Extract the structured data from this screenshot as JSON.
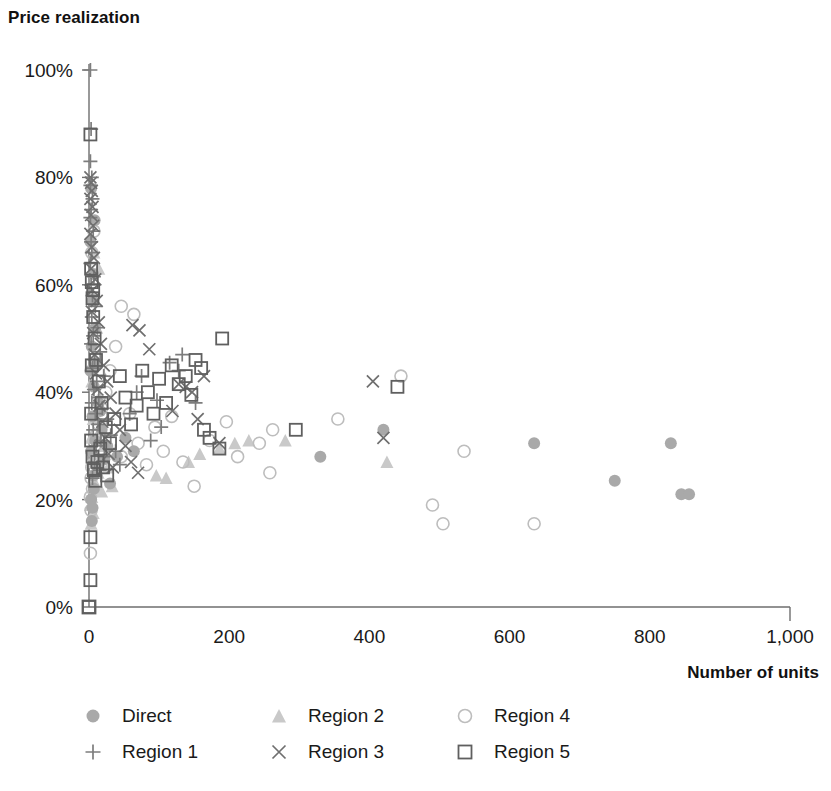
{
  "chart_data": {
    "type": "scatter",
    "title": "Price realization",
    "xlabel": "Number of units",
    "ylabel": "Price realization",
    "xlim": [
      0,
      1000
    ],
    "ylim": [
      0,
      1.0
    ],
    "grid": false,
    "legend_position": "bottom-left",
    "x_ticks": [
      0,
      200,
      400,
      600,
      800,
      1000
    ],
    "x_tick_labels": [
      "0",
      "200",
      "400",
      "600",
      "800",
      "1,000"
    ],
    "y_ticks": [
      0,
      20,
      40,
      60,
      80,
      100
    ],
    "y_tick_labels": [
      "0%",
      "20%",
      "40%",
      "60%",
      "80%",
      "100%"
    ],
    "series": [
      {
        "name": "Direct",
        "marker": "filled-circle",
        "color": "#a9a9a9",
        "points": [
          [
            330,
            28.0
          ],
          [
            420,
            33.0
          ],
          [
            635,
            30.5
          ],
          [
            750,
            23.5
          ],
          [
            830,
            30.5
          ],
          [
            845,
            21.0
          ],
          [
            856,
            21.0
          ],
          [
            6,
            62.0
          ],
          [
            5,
            57.0
          ],
          [
            9,
            52.0
          ],
          [
            4,
            48.5
          ],
          [
            11,
            45.0
          ],
          [
            7,
            41.0
          ],
          [
            14,
            38.0
          ],
          [
            5,
            35.5
          ],
          [
            18,
            33.0
          ],
          [
            9,
            31.0
          ],
          [
            3,
            29.0
          ],
          [
            22,
            27.5
          ],
          [
            12,
            26.0
          ],
          [
            6,
            24.5
          ],
          [
            30,
            23.0
          ],
          [
            16,
            36.5
          ],
          [
            26,
            30.0
          ],
          [
            40,
            28.0
          ],
          [
            52,
            31.5
          ],
          [
            64,
            29.0
          ],
          [
            3,
            20.0
          ],
          [
            5,
            18.5
          ],
          [
            4,
            16.0
          ],
          [
            7,
            22.0
          ],
          [
            2,
            44.0
          ],
          [
            2,
            68.0
          ],
          [
            8,
            72.0
          ],
          [
            3,
            78.0
          ]
        ]
      },
      {
        "name": "Region 1",
        "marker": "plus",
        "color": "#7d7d7d",
        "points": [
          [
            2,
            100.0
          ],
          [
            3,
            89.0
          ],
          [
            2,
            83.0
          ],
          [
            4,
            80.0
          ],
          [
            2,
            78.5
          ],
          [
            5,
            76.0
          ],
          [
            3,
            74.0
          ],
          [
            2,
            72.5
          ],
          [
            6,
            70.0
          ],
          [
            3,
            68.0
          ],
          [
            4,
            66.0
          ],
          [
            2,
            64.0
          ],
          [
            7,
            61.5
          ],
          [
            3,
            60.0
          ],
          [
            5,
            58.0
          ],
          [
            9,
            56.0
          ],
          [
            4,
            54.0
          ],
          [
            12,
            52.0
          ],
          [
            6,
            50.5
          ],
          [
            3,
            49.0
          ],
          [
            16,
            47.5
          ],
          [
            8,
            46.0
          ],
          [
            5,
            44.5
          ],
          [
            21,
            43.0
          ],
          [
            11,
            42.0
          ],
          [
            7,
            40.5
          ],
          [
            14,
            39.0
          ],
          [
            4,
            38.0
          ],
          [
            19,
            37.0
          ],
          [
            9,
            36.0
          ],
          [
            26,
            35.0
          ],
          [
            13,
            34.0
          ],
          [
            6,
            33.0
          ],
          [
            31,
            32.0
          ],
          [
            17,
            31.0
          ],
          [
            10,
            30.0
          ],
          [
            38,
            29.0
          ],
          [
            22,
            28.0
          ],
          [
            8,
            27.0
          ],
          [
            44,
            26.5
          ],
          [
            15,
            25.5
          ],
          [
            5,
            24.0
          ],
          [
            115,
            45.5
          ],
          [
            128,
            44.0
          ],
          [
            97,
            38.5
          ],
          [
            103,
            33.5
          ],
          [
            88,
            31.0
          ],
          [
            133,
            47.0
          ],
          [
            75,
            43.0
          ],
          [
            68,
            40.0
          ],
          [
            152,
            38.0
          ],
          [
            58,
            36.0
          ]
        ]
      },
      {
        "name": "Region 2",
        "marker": "filled-triangle",
        "color": "#c9c9c9",
        "points": [
          [
            280,
            31.0
          ],
          [
            425,
            27.0
          ],
          [
            208,
            30.5
          ],
          [
            228,
            31.0
          ],
          [
            186,
            29.5
          ],
          [
            96,
            24.5
          ],
          [
            110,
            24.0
          ],
          [
            142,
            27.0
          ],
          [
            158,
            28.5
          ],
          [
            8,
            46.0
          ],
          [
            4,
            42.0
          ],
          [
            12,
            38.5
          ],
          [
            6,
            35.0
          ],
          [
            16,
            33.0
          ],
          [
            3,
            31.5
          ],
          [
            21,
            30.0
          ],
          [
            9,
            28.5
          ],
          [
            5,
            27.0
          ],
          [
            27,
            26.0
          ],
          [
            13,
            25.0
          ],
          [
            7,
            23.5
          ],
          [
            33,
            22.5
          ],
          [
            18,
            21.5
          ],
          [
            4,
            20.5
          ],
          [
            2,
            19.0
          ],
          [
            6,
            17.5
          ],
          [
            3,
            15.5
          ],
          [
            11,
            52.0
          ],
          [
            5,
            58.0
          ],
          [
            14,
            63.0
          ],
          [
            7,
            66.0
          ]
        ]
      },
      {
        "name": "Region 3",
        "marker": "cross",
        "color": "#6f6f6f",
        "points": [
          [
            405,
            42.0
          ],
          [
            420,
            31.5
          ],
          [
            62,
            52.5
          ],
          [
            72,
            51.5
          ],
          [
            86,
            48.0
          ],
          [
            128,
            41.5
          ],
          [
            138,
            41.0
          ],
          [
            147,
            40.0
          ],
          [
            164,
            43.0
          ],
          [
            186,
            30.5
          ],
          [
            155,
            35.0
          ],
          [
            119,
            36.5
          ],
          [
            2,
            80.0
          ],
          [
            3,
            79.0
          ],
          [
            4,
            77.5
          ],
          [
            2,
            76.0
          ],
          [
            5,
            74.5
          ],
          [
            3,
            73.0
          ],
          [
            6,
            71.0
          ],
          [
            2,
            69.5
          ],
          [
            4,
            67.0
          ],
          [
            7,
            65.0
          ],
          [
            3,
            63.0
          ],
          [
            9,
            61.0
          ],
          [
            5,
            59.0
          ],
          [
            11,
            57.0
          ],
          [
            4,
            55.0
          ],
          [
            14,
            53.0
          ],
          [
            6,
            51.0
          ],
          [
            17,
            49.0
          ],
          [
            8,
            47.0
          ],
          [
            21,
            45.0
          ],
          [
            10,
            43.5
          ],
          [
            26,
            42.0
          ],
          [
            12,
            40.5
          ],
          [
            31,
            39.0
          ],
          [
            15,
            37.5
          ],
          [
            38,
            36.0
          ],
          [
            19,
            34.5
          ],
          [
            44,
            33.0
          ],
          [
            23,
            31.5
          ],
          [
            52,
            30.0
          ],
          [
            28,
            28.5
          ],
          [
            60,
            27.0
          ],
          [
            34,
            26.0
          ],
          [
            70,
            25.0
          ]
        ]
      },
      {
        "name": "Region 4",
        "marker": "open-circle",
        "color": "#bdbdbd",
        "points": [
          [
            355,
            35.0
          ],
          [
            445,
            43.0
          ],
          [
            490,
            19.0
          ],
          [
            505,
            15.5
          ],
          [
            535,
            29.0
          ],
          [
            635,
            15.5
          ],
          [
            243,
            30.5
          ],
          [
            258,
            25.0
          ],
          [
            262,
            33.0
          ],
          [
            212,
            28.0
          ],
          [
            196,
            34.5
          ],
          [
            172,
            31.0
          ],
          [
            150,
            22.5
          ],
          [
            134,
            27.0
          ],
          [
            118,
            35.5
          ],
          [
            106,
            29.0
          ],
          [
            94,
            33.5
          ],
          [
            82,
            26.5
          ],
          [
            70,
            30.5
          ],
          [
            58,
            36.0
          ],
          [
            46,
            28.0
          ],
          [
            64,
            54.5
          ],
          [
            46,
            56.0
          ],
          [
            38,
            48.5
          ],
          [
            30,
            44.0
          ],
          [
            24,
            40.0
          ],
          [
            18,
            37.0
          ],
          [
            14,
            34.0
          ],
          [
            10,
            32.0
          ],
          [
            8,
            30.0
          ],
          [
            6,
            28.0
          ],
          [
            4,
            26.0
          ],
          [
            3,
            24.0
          ],
          [
            5,
            22.0
          ],
          [
            2,
            20.5
          ],
          [
            3,
            18.0
          ],
          [
            2,
            10.0
          ],
          [
            4,
            66.0
          ],
          [
            7,
            70.0
          ]
        ]
      },
      {
        "name": "Region 5",
        "marker": "open-square",
        "color": "#5f5f5f",
        "points": [
          [
            190,
            50.0
          ],
          [
            295,
            33.0
          ],
          [
            440,
            41.0
          ],
          [
            0,
            0.0
          ],
          [
            152,
            46.0
          ],
          [
            160,
            44.5
          ],
          [
            138,
            43.0
          ],
          [
            146,
            39.5
          ],
          [
            128,
            41.5
          ],
          [
            118,
            45.0
          ],
          [
            110,
            38.0
          ],
          [
            100,
            42.5
          ],
          [
            92,
            36.0
          ],
          [
            84,
            40.0
          ],
          [
            76,
            44.0
          ],
          [
            68,
            37.5
          ],
          [
            60,
            34.0
          ],
          [
            52,
            39.0
          ],
          [
            44,
            43.0
          ],
          [
            36,
            35.0
          ],
          [
            30,
            30.5
          ],
          [
            24,
            33.5
          ],
          [
            18,
            38.0
          ],
          [
            14,
            42.0
          ],
          [
            10,
            46.0
          ],
          [
            8,
            50.0
          ],
          [
            6,
            54.0
          ],
          [
            5,
            57.5
          ],
          [
            4,
            60.5
          ],
          [
            3,
            63.0
          ],
          [
            6,
            59.0
          ],
          [
            4,
            45.0
          ],
          [
            3,
            31.0
          ],
          [
            5,
            28.0
          ],
          [
            7,
            25.5
          ],
          [
            9,
            23.5
          ],
          [
            12,
            27.0
          ],
          [
            16,
            29.5
          ],
          [
            20,
            26.0
          ],
          [
            26,
            24.5
          ],
          [
            2,
            88.0
          ],
          [
            3,
            36.0
          ],
          [
            2,
            13.0
          ],
          [
            2,
            5.0
          ],
          [
            186,
            29.5
          ],
          [
            172,
            31.5
          ],
          [
            164,
            33.0
          ]
        ]
      }
    ]
  },
  "legend": {
    "rows": [
      [
        {
          "label": "Direct",
          "marker": "filled-circle",
          "color": "#a9a9a9"
        },
        {
          "label": "Region 2",
          "marker": "filled-triangle",
          "color": "#c9c9c9"
        },
        {
          "label": "Region 4",
          "marker": "open-circle",
          "color": "#bdbdbd"
        }
      ],
      [
        {
          "label": "Region 1",
          "marker": "plus",
          "color": "#7d7d7d"
        },
        {
          "label": "Region 3",
          "marker": "cross",
          "color": "#6f6f6f"
        },
        {
          "label": "Region 5",
          "marker": "open-square",
          "color": "#5f5f5f"
        }
      ]
    ]
  },
  "axes": {
    "axis_color": "#6e6e6e"
  }
}
